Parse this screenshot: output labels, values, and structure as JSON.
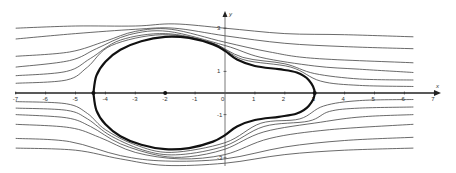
{
  "diagram": {
    "colors": {
      "background": "#ffffff",
      "axis": "#222222",
      "body": "#111111",
      "streamline": "#444444",
      "text": "#333333"
    },
    "axes": {
      "x_label": "x",
      "y_label": "y",
      "origin_label": "0",
      "x_ticks": [
        {
          "v": -7,
          "label": "-7"
        },
        {
          "v": -6,
          "label": "-6"
        },
        {
          "v": -5,
          "label": "-5"
        },
        {
          "v": -4,
          "label": "-4"
        },
        {
          "v": -3,
          "label": "-3"
        },
        {
          "v": -2,
          "label": "-2"
        },
        {
          "v": -1,
          "label": "-1"
        },
        {
          "v": 1,
          "label": "1"
        },
        {
          "v": 2,
          "label": "2"
        },
        {
          "v": 3,
          "label": "3"
        },
        {
          "v": 4,
          "label": "4"
        },
        {
          "v": 5,
          "label": "5"
        },
        {
          "v": 6,
          "label": "6"
        },
        {
          "v": 7,
          "label": "7"
        }
      ],
      "y_ticks": [
        {
          "v": 3,
          "label": "3"
        },
        {
          "v": 1,
          "label": "1"
        },
        {
          "v": -1,
          "label": "-1"
        },
        {
          "v": -3,
          "label": "-3"
        }
      ],
      "xlim": [
        -7,
        7
      ],
      "ylim": [
        -3.5,
        3.7
      ]
    },
    "points": [
      {
        "name": "stagnation-left",
        "x": -4.4,
        "y": 0
      },
      {
        "name": "source",
        "x": -2,
        "y": 0
      },
      {
        "name": "stagnation-right",
        "x": 3,
        "y": 0
      }
    ],
    "body_outline": [
      [
        -4.4,
        0
      ],
      [
        -4.3,
        0.8
      ],
      [
        -4.0,
        1.45
      ],
      [
        -3.5,
        2.0
      ],
      [
        -2.8,
        2.4
      ],
      [
        -2,
        2.6
      ],
      [
        -1.2,
        2.55
      ],
      [
        -0.4,
        2.25
      ],
      [
        0,
        1.95
      ],
      [
        0.4,
        1.55
      ],
      [
        1,
        1.25
      ],
      [
        1.8,
        1.1
      ],
      [
        2.4,
        0.95
      ],
      [
        2.8,
        0.6
      ],
      [
        3,
        0
      ],
      [
        2.8,
        -0.6
      ],
      [
        2.4,
        -0.95
      ],
      [
        1.8,
        -1.1
      ],
      [
        1,
        -1.25
      ],
      [
        0.4,
        -1.55
      ],
      [
        0,
        -1.95
      ],
      [
        -0.4,
        -2.25
      ],
      [
        -1.2,
        -2.55
      ],
      [
        -2,
        -2.6
      ],
      [
        -2.8,
        -2.4
      ],
      [
        -3.5,
        -2.0
      ],
      [
        -4.0,
        -1.45
      ],
      [
        -4.3,
        -0.8
      ],
      [
        -4.4,
        0
      ]
    ],
    "streamlines_upper": [
      [
        [
          -7,
          3.0
        ],
        [
          -5,
          3.1
        ],
        [
          -3,
          3.1
        ],
        [
          -1.7,
          3.2
        ],
        [
          0,
          3.0
        ],
        [
          2,
          2.75
        ],
        [
          4,
          2.7
        ],
        [
          6.3,
          2.6
        ]
      ],
      [
        [
          -7,
          2.5
        ],
        [
          -5,
          2.75
        ],
        [
          -3,
          2.95
        ],
        [
          -1.7,
          3.0
        ],
        [
          0,
          2.65
        ],
        [
          2,
          2.3
        ],
        [
          4,
          2.15
        ],
        [
          6.3,
          2.05
        ]
      ],
      [
        [
          -7,
          1.7
        ],
        [
          -5.2,
          1.9
        ],
        [
          -4,
          2.4
        ],
        [
          -3,
          2.85
        ],
        [
          -1.8,
          2.95
        ],
        [
          0,
          2.35
        ],
        [
          1.5,
          1.9
        ],
        [
          3,
          1.6
        ],
        [
          6.3,
          1.4
        ]
      ],
      [
        [
          -7,
          1.2
        ],
        [
          -5.2,
          1.5
        ],
        [
          -4.3,
          2.05
        ],
        [
          -3.2,
          2.7
        ],
        [
          -1.9,
          2.85
        ],
        [
          0,
          2.2
        ],
        [
          1.2,
          1.65
        ],
        [
          3,
          1.25
        ],
        [
          4.5,
          1.1
        ],
        [
          6.3,
          0.95
        ]
      ],
      [
        [
          -7,
          0.8
        ],
        [
          -5.3,
          1.0
        ],
        [
          -4.5,
          1.6
        ],
        [
          -3.5,
          2.45
        ],
        [
          -2,
          2.75
        ],
        [
          -0.5,
          2.35
        ],
        [
          0.6,
          1.65
        ],
        [
          2,
          1.35
        ],
        [
          3,
          0.9
        ],
        [
          4.5,
          0.65
        ],
        [
          6.3,
          0.6
        ]
      ],
      [
        [
          -7,
          0.45
        ],
        [
          -5.3,
          0.6
        ],
        [
          -4.6,
          1.2
        ],
        [
          -3.8,
          2.2
        ],
        [
          -2.1,
          2.7
        ],
        [
          -0.4,
          2.3
        ],
        [
          0.6,
          1.55
        ],
        [
          2.2,
          1.2
        ],
        [
          3.2,
          0.55
        ],
        [
          4.5,
          0.35
        ],
        [
          6.3,
          0.3
        ]
      ]
    ],
    "streamlines_lower": [
      [
        [
          -7,
          -0.4
        ],
        [
          -5.3,
          -0.5
        ],
        [
          -4.6,
          -0.95
        ],
        [
          -4,
          -1.7
        ],
        [
          -3,
          -2.4
        ],
        [
          -1.8,
          -2.75
        ],
        [
          0,
          -2.3
        ],
        [
          1.2,
          -1.4
        ],
        [
          2.5,
          -1.2
        ],
        [
          3.3,
          -0.6
        ],
        [
          4.5,
          -0.35
        ],
        [
          6.3,
          -0.3
        ]
      ],
      [
        [
          -7,
          -0.7
        ],
        [
          -5.3,
          -0.8
        ],
        [
          -4.6,
          -1.2
        ],
        [
          -3.8,
          -2.0
        ],
        [
          -2.6,
          -2.7
        ],
        [
          -1.5,
          -2.85
        ],
        [
          0,
          -2.45
        ],
        [
          1.3,
          -1.55
        ],
        [
          2.8,
          -1.3
        ],
        [
          3.5,
          -0.85
        ],
        [
          4.5,
          -0.7
        ],
        [
          6.3,
          -0.65
        ]
      ],
      [
        [
          -7,
          -1.0
        ],
        [
          -5.3,
          -1.15
        ],
        [
          -4.5,
          -1.55
        ],
        [
          -3.5,
          -2.35
        ],
        [
          -2.2,
          -2.9
        ],
        [
          -1.2,
          -2.95
        ],
        [
          0,
          -2.6
        ],
        [
          1.3,
          -1.8
        ],
        [
          3.2,
          -1.35
        ],
        [
          4.6,
          -1.1
        ],
        [
          6.3,
          -1.0
        ]
      ],
      [
        [
          -7,
          -1.45
        ],
        [
          -5.2,
          -1.6
        ],
        [
          -4.2,
          -2.05
        ],
        [
          -3,
          -2.75
        ],
        [
          -1.5,
          -3.05
        ],
        [
          0,
          -2.85
        ],
        [
          1.5,
          -2.1
        ],
        [
          3.5,
          -1.7
        ],
        [
          6.3,
          -1.45
        ]
      ],
      [
        [
          -7,
          -2.1
        ],
        [
          -5.2,
          -2.25
        ],
        [
          -3.5,
          -2.9
        ],
        [
          -2,
          -3.15
        ],
        [
          0,
          -3.05
        ],
        [
          2,
          -2.5
        ],
        [
          4,
          -2.2
        ],
        [
          6.3,
          -2.05
        ]
      ],
      [
        [
          -7,
          -2.55
        ],
        [
          -5,
          -2.65
        ],
        [
          -3.5,
          -3.05
        ],
        [
          -2,
          -3.35
        ],
        [
          0,
          -3.25
        ],
        [
          2,
          -2.85
        ],
        [
          4,
          -2.65
        ],
        [
          6.3,
          -2.55
        ]
      ]
    ]
  }
}
